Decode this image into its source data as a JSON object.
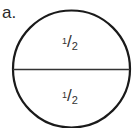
{
  "label": "a.",
  "circle": {
    "stroke_color": "#1a1a1a",
    "parts": [
      {
        "numerator": "1",
        "denominator": "2"
      },
      {
        "numerator": "1",
        "denominator": "2"
      }
    ]
  }
}
